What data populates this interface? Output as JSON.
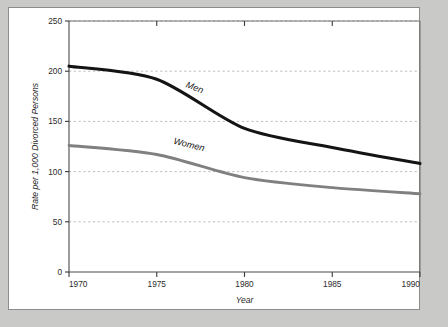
{
  "figure": {
    "background_color": "#c9c9c7",
    "card_color": "#ffffff",
    "border_color": "#8c8c8c"
  },
  "chart_data": {
    "type": "line",
    "title": "",
    "subtitle": "",
    "xlabel": "Year",
    "ylabel": "Rate per 1,000 Divorced Persons",
    "x": [
      1970,
      1975,
      1980,
      1985,
      1990
    ],
    "xlim": [
      1970,
      1990
    ],
    "ylim": [
      0,
      250
    ],
    "xticks": [
      1970,
      1975,
      1980,
      1985,
      1990
    ],
    "xtick_labels": [
      "1970",
      "1975",
      "1980",
      "1985",
      "1990"
    ],
    "yticks": [
      0,
      50,
      100,
      150,
      200,
      250
    ],
    "ytick_labels": [
      "0",
      "50",
      "100",
      "150",
      "200",
      "250"
    ],
    "grid": "horizontal-dashed",
    "gridlines_at": [
      50,
      100,
      150,
      200,
      250
    ],
    "grid_color": "#b4b4b4",
    "legend": "inline-labels",
    "legend_position": "on-series",
    "series": [
      {
        "name": "Men",
        "color": "#141414",
        "width": 3.1,
        "values": [
          205,
          192,
          143,
          124,
          108
        ],
        "label_x": 1977.1,
        "label_y": 181,
        "label_rotation": 21
      },
      {
        "name": "Women",
        "color": "#808080",
        "width": 2.9,
        "values": [
          126,
          117,
          94,
          84,
          78
        ],
        "label_x": 1976.8,
        "label_y": 124,
        "label_rotation": 14
      }
    ]
  }
}
